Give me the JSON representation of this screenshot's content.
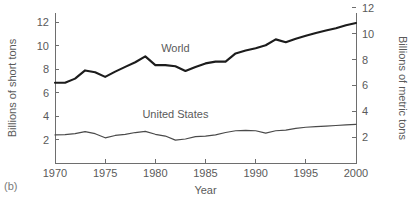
{
  "figure": {
    "panel_label": "(b)"
  },
  "chart_data": {
    "type": "line",
    "title": "",
    "xlabel": "Year",
    "ylabel": "Billions of short tons",
    "y2label": "Billions of metric tons",
    "xlim": [
      1970,
      2000
    ],
    "ylim": [
      0,
      12.8
    ],
    "y2lim": [
      0,
      11.61
    ],
    "grid": false,
    "legend_position": "inline",
    "xticks": [
      1970,
      1975,
      1980,
      1985,
      1990,
      1995,
      2000
    ],
    "xtick_labels": [
      "1970",
      "1975",
      "1980",
      "1985",
      "1990",
      "1995",
      "2000"
    ],
    "yticks": [
      2,
      4,
      6,
      8,
      10,
      12
    ],
    "ytick_labels": [
      "2",
      "4",
      "6",
      "8",
      "10",
      "12"
    ],
    "y2ticks": [
      2,
      4,
      6,
      8,
      10,
      12
    ],
    "y2tick_labels": [
      "2",
      "4",
      "6",
      "8",
      "10",
      "12"
    ],
    "x": [
      1970,
      1971,
      1972,
      1973,
      1974,
      1975,
      1976,
      1977,
      1978,
      1979,
      1980,
      1981,
      1982,
      1983,
      1984,
      1985,
      1986,
      1987,
      1988,
      1989,
      1990,
      1991,
      1992,
      1993,
      1994,
      1995,
      1996,
      1997,
      1998,
      1999,
      2000
    ],
    "series": [
      {
        "name": "World",
        "values": [
          6.85,
          6.85,
          7.2,
          7.9,
          7.75,
          7.35,
          7.8,
          8.2,
          8.6,
          9.1,
          8.35,
          8.35,
          8.25,
          7.85,
          8.2,
          8.5,
          8.65,
          8.65,
          9.35,
          9.6,
          9.8,
          10.05,
          10.55,
          10.3,
          10.6,
          10.85,
          11.1,
          11.3,
          11.5,
          11.75,
          11.95
        ],
        "label_x": 1982,
        "label_y": 9.45,
        "label_text": "World"
      },
      {
        "name": "United States",
        "values": [
          2.4,
          2.42,
          2.5,
          2.68,
          2.5,
          2.15,
          2.35,
          2.45,
          2.6,
          2.7,
          2.45,
          2.3,
          1.95,
          2.05,
          2.25,
          2.3,
          2.4,
          2.6,
          2.75,
          2.78,
          2.75,
          2.55,
          2.75,
          2.8,
          2.95,
          3.05,
          3.1,
          3.15,
          3.2,
          3.25,
          3.3
        ],
        "label_x": 1982,
        "label_y": 3.85,
        "label_text": "United States"
      }
    ]
  }
}
